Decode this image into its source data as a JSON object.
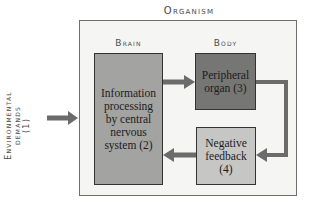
{
  "diagram": {
    "title": "Organism",
    "sections": {
      "brain": "Brain",
      "body": "Body"
    },
    "input": {
      "label_line1": "Environmental",
      "label_line2": "demands",
      "label_line3": "(1)"
    },
    "nodes": [
      {
        "id": "brain",
        "label": "Information processing by central nervous system (2)"
      },
      {
        "id": "peripheral",
        "label": "Peripheral organ (3)"
      },
      {
        "id": "feedback",
        "label": "Negative feedback (4)"
      }
    ],
    "edges": [
      {
        "from": "environment",
        "to": "brain"
      },
      {
        "from": "brain",
        "to": "peripheral"
      },
      {
        "from": "peripheral",
        "to": "feedback"
      },
      {
        "from": "feedback",
        "to": "brain"
      }
    ],
    "colors": {
      "brain_fill": "#a3a3a1",
      "peripheral_fill": "#767674",
      "feedback_fill": "#c6c6c4",
      "arrow": "#6b6b6b",
      "container_fill": "#f5f5f4"
    }
  }
}
